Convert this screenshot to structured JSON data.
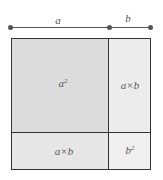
{
  "diagram": {
    "title": "",
    "dimension_labels": {
      "top_left": "a",
      "top_right": "b"
    },
    "regions": [
      {
        "id": "a-squared",
        "label_base": "a",
        "label_sup": "2",
        "fill": "#dcdcdc"
      },
      {
        "id": "top-right-product",
        "label": "a×b",
        "fill": "#ececec"
      },
      {
        "id": "bottom-left-product",
        "label": "a×b",
        "fill": "#e6e6e6"
      },
      {
        "id": "b-squared",
        "label_base": "b",
        "label_sup": "2",
        "fill": "#f0f0f0"
      }
    ],
    "colors": {
      "stroke": "#333333",
      "dimension_line": "#555555"
    }
  }
}
